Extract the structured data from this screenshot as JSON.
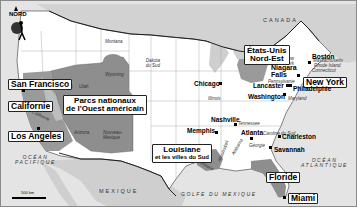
{
  "map": {
    "compass": {
      "label": "NORD",
      "icon": "north-arrow-hiker-icon"
    },
    "scale": {
      "label": "500 km"
    },
    "countries": [
      {
        "id": "canada",
        "label": "CANADA"
      },
      {
        "id": "mexique",
        "label": "MEXIQUE"
      }
    ],
    "seas": [
      {
        "id": "pacifique",
        "line1": "OCÉAN",
        "line2": "PACIFIQUE"
      },
      {
        "id": "atlantique",
        "line1": "OCÉAN",
        "line2": "ATLANTIQUE"
      },
      {
        "id": "golfe",
        "line1": "GOLFE DU MEXIQUE"
      }
    ],
    "regions": [
      {
        "id": "parcs",
        "line1": "Parcs nationaux",
        "line2": "de l'Ouest américain"
      },
      {
        "id": "nordest",
        "line1": "États-Unis",
        "line2": "Nord-Est"
      },
      {
        "id": "louisiane",
        "line1": "Louisiane",
        "line2": "et les villes du Sud"
      },
      {
        "id": "californie",
        "line1": "Californie"
      },
      {
        "id": "floride",
        "line1": "Floride"
      }
    ],
    "boxed_cities": [
      {
        "id": "sanfrancisco",
        "label": "San Francisco"
      },
      {
        "id": "losangeles",
        "label": "Los Angeles"
      },
      {
        "id": "newyork",
        "label": "New York"
      },
      {
        "id": "miami",
        "label": "Miami"
      }
    ],
    "cities": [
      {
        "id": "chicago",
        "label": "Chicago"
      },
      {
        "id": "boston",
        "label": "Boston"
      },
      {
        "id": "niagara",
        "label": "Niagara Falls"
      },
      {
        "id": "lancaster",
        "label": "Lancaster"
      },
      {
        "id": "philadelphia",
        "label": "Philadelphie"
      },
      {
        "id": "washington",
        "label": "Washington"
      },
      {
        "id": "nashville",
        "label": "Nashville"
      },
      {
        "id": "memphis",
        "label": "Memphis"
      },
      {
        "id": "atlanta",
        "label": "Atlanta"
      },
      {
        "id": "charleston",
        "label": "Charleston"
      },
      {
        "id": "savannah",
        "label": "Savannah"
      }
    ],
    "states": [
      {
        "id": "montana",
        "label": "Montana"
      },
      {
        "id": "wyoming",
        "label": "Wyoming"
      },
      {
        "id": "dakota",
        "label": "Dakota du Sud"
      },
      {
        "id": "nevada",
        "label": "Nevada"
      },
      {
        "id": "utah",
        "label": "Utah"
      },
      {
        "id": "colorado",
        "label": "Colorado"
      },
      {
        "id": "arizona",
        "label": "Arizona"
      },
      {
        "id": "nmexico",
        "label": "Nouveau-Mexique"
      },
      {
        "id": "californie_st",
        "label": "Californie"
      },
      {
        "id": "illinois",
        "label": "Illinois"
      },
      {
        "id": "tennessee",
        "label": "Tennessee"
      },
      {
        "id": "georgie",
        "label": "Géorgie"
      },
      {
        "id": "carolinesud",
        "label": "Caroline du Sud"
      },
      {
        "id": "newyork_st",
        "label": "New York"
      },
      {
        "id": "massachusetts",
        "label": "Massachusetts"
      },
      {
        "id": "rhodeisland",
        "label": "Rhode Island"
      },
      {
        "id": "connecticut",
        "label": "Connecticut"
      },
      {
        "id": "pennsylvanie",
        "label": "Pennsylvanie"
      },
      {
        "id": "maryland",
        "label": "Maryland"
      },
      {
        "id": "mississippi",
        "label": "Mississippi"
      },
      {
        "id": "alabama",
        "label": "Alabama"
      },
      {
        "id": "louisiane_st",
        "label": "Louisiane"
      }
    ],
    "colors": {
      "land": "#ffffff",
      "foreign": "#d4d4d4",
      "water": "#e6e6e6",
      "highlight": "#8c8c8c",
      "border": "#222222"
    }
  }
}
